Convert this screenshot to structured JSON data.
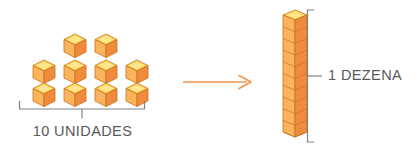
{
  "figure": {
    "background_color": "#ffffff"
  },
  "units_group": {
    "label": "10 UNIDADES",
    "cube_count": 10,
    "rows": [
      {
        "count": 2,
        "cubes": [
          {
            "x": 62,
            "y": 33
          },
          {
            "x": 93,
            "y": 33
          }
        ]
      },
      {
        "count": 4,
        "cubes": [
          {
            "x": 31,
            "y": 59
          },
          {
            "x": 62,
            "y": 59
          },
          {
            "x": 93,
            "y": 59
          },
          {
            "x": 124,
            "y": 59
          }
        ]
      },
      {
        "count": 4,
        "cubes": [
          {
            "x": 31,
            "y": 82
          },
          {
            "x": 62,
            "y": 82
          },
          {
            "x": 93,
            "y": 82
          },
          {
            "x": 124,
            "y": 82
          }
        ]
      }
    ],
    "bracket": {
      "orientation": "horizontal",
      "tick_position": "center-down",
      "color": "#808285"
    }
  },
  "arrow": {
    "direction": "right",
    "color": "#F0964B",
    "label": ""
  },
  "ten_group": {
    "label": "1 DEZENA",
    "cube_count": 10,
    "stack_orientation": "vertical",
    "bracket": {
      "orientation": "vertical",
      "tick_position": "middle-right",
      "color": "#808285"
    }
  },
  "colors": {
    "cube_top": "#FFD24A",
    "cube_top_highlight": "#FFE68C",
    "cube_left": "#FBB45C",
    "cube_right": "#F08A3C",
    "cube_outline": "#C8721F",
    "arrow": "#F0964B",
    "bracket": "#808285",
    "text": "#58595b",
    "background": "#ffffff"
  }
}
